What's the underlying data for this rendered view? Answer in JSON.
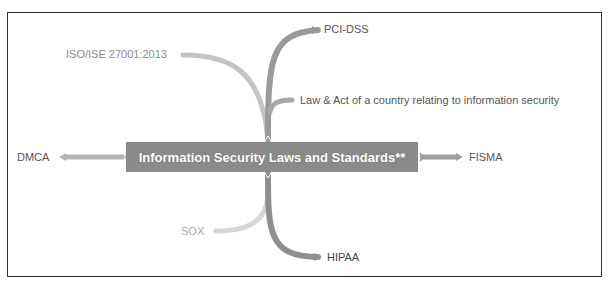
{
  "diagram": {
    "type": "mind-map",
    "central_topic": "Information Security Laws and Standards**",
    "branches": [
      {
        "label": "PCI-DSS",
        "direction": "up-right",
        "color": "#9a9a9a"
      },
      {
        "label": "ISO/ISE 27001:2013",
        "direction": "up-left",
        "color": "#c4c4c4"
      },
      {
        "label": "Law & Act of a country relating to information security",
        "direction": "up-right",
        "color": "#a8a8a8"
      },
      {
        "label": "DMCA",
        "direction": "left",
        "color": "#b5b5b5"
      },
      {
        "label": "FISMA",
        "direction": "right",
        "color": "#9f9f9f"
      },
      {
        "label": "SOX",
        "direction": "down-left",
        "color": "#d6d6d6"
      },
      {
        "label": "HIPAA",
        "direction": "down-right",
        "color": "#8f8f8f"
      }
    ],
    "colors": {
      "central_bg": "#8a8a8a",
      "central_text": "#ffffff",
      "border": "#333333"
    }
  }
}
